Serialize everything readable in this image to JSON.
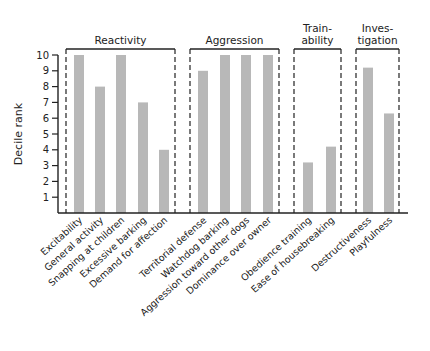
{
  "chart_data": {
    "type": "bar",
    "title": "",
    "xlabel": "",
    "ylabel": "Decile rank",
    "ylim": [
      0,
      10
    ],
    "yticks": [
      1,
      2,
      3,
      4,
      5,
      6,
      7,
      8,
      9,
      10
    ],
    "grid": false,
    "bar_color": "#b8b8b8",
    "categories": [
      "Excitability",
      "General activity",
      "Snapping at children",
      "Excessive barking",
      "Demand for affection",
      "Territorial defense",
      "Watchdog barking",
      "Aggression toward other dogs",
      "Dominance over owner",
      "Obedience training",
      "Ease of housebreaking",
      "Destructiveness",
      "Playfulness"
    ],
    "values": [
      10,
      8,
      10,
      7,
      4,
      9,
      10,
      10,
      10,
      3.2,
      4.2,
      9.2,
      6.3
    ],
    "groups": [
      {
        "label_lines": [
          "Reactivity"
        ],
        "members": [
          0,
          1,
          2,
          3,
          4
        ]
      },
      {
        "label_lines": [
          "Aggression"
        ],
        "members": [
          5,
          6,
          7,
          8
        ]
      },
      {
        "label_lines": [
          "Train-",
          "ability"
        ],
        "members": [
          9,
          10
        ]
      },
      {
        "label_lines": [
          "Inves-",
          "tigation"
        ],
        "members": [
          11,
          12
        ]
      }
    ]
  }
}
